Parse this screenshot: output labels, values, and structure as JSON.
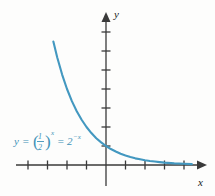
{
  "figure": {
    "background_color": "#fdfdfc",
    "curve_color": "#4398c0",
    "axis_color": "#3a3a3a",
    "label_color": "#1a1a1a"
  },
  "axes": {
    "x_label": "x",
    "y_label": "y",
    "origin": {
      "x": 106,
      "y": 165
    },
    "x_tick_spacing": 19.5,
    "y_tick_spacing": 19,
    "x_ticks": [
      -4,
      -3,
      -2,
      -1,
      1,
      2,
      3,
      4
    ],
    "y_ticks": [
      1,
      2,
      3,
      4,
      5,
      6,
      7
    ],
    "x_range": [
      -4.6,
      4.7
    ],
    "y_range": [
      -0.6,
      7.5
    ]
  },
  "equation": {
    "lhs": "y",
    "equals": "=",
    "base_numerator": "1",
    "base_denominator": "2",
    "exponent": "x",
    "equals2": "=",
    "rhs_base": "2",
    "rhs_exponent": "−x",
    "plain": "y = (1/2)^x = 2^(-x)"
  },
  "chart_data": {
    "type": "line",
    "title": "",
    "xlabel": "x",
    "ylabel": "y",
    "xlim": [
      -4.6,
      4.7
    ],
    "ylim": [
      -0.6,
      7.5
    ],
    "grid": false,
    "legend": "none",
    "annotations": [
      {
        "text": "y = (1/2)^x = 2^(-x)",
        "x": -3.9,
        "y": 1.1,
        "color": "#4398c0"
      }
    ],
    "series": [
      {
        "name": "y = (1/2)^x = 2^(-x)",
        "color": "#4398c0",
        "x": [
          -2.7,
          -2.5,
          -2.25,
          -2.0,
          -1.75,
          -1.5,
          -1.25,
          -1.0,
          -0.75,
          -0.5,
          -0.25,
          0,
          0.25,
          0.5,
          0.75,
          1.0,
          1.25,
          1.5,
          1.75,
          2.0,
          2.25,
          2.5,
          2.75,
          3.0,
          3.5,
          4.0,
          4.4
        ],
        "y": [
          6.5,
          5.66,
          4.76,
          4.0,
          3.36,
          2.83,
          2.38,
          2.0,
          1.68,
          1.41,
          1.19,
          1.0,
          0.84,
          0.71,
          0.59,
          0.5,
          0.42,
          0.35,
          0.3,
          0.25,
          0.21,
          0.18,
          0.15,
          0.125,
          0.088,
          0.0625,
          0.047
        ]
      }
    ]
  }
}
